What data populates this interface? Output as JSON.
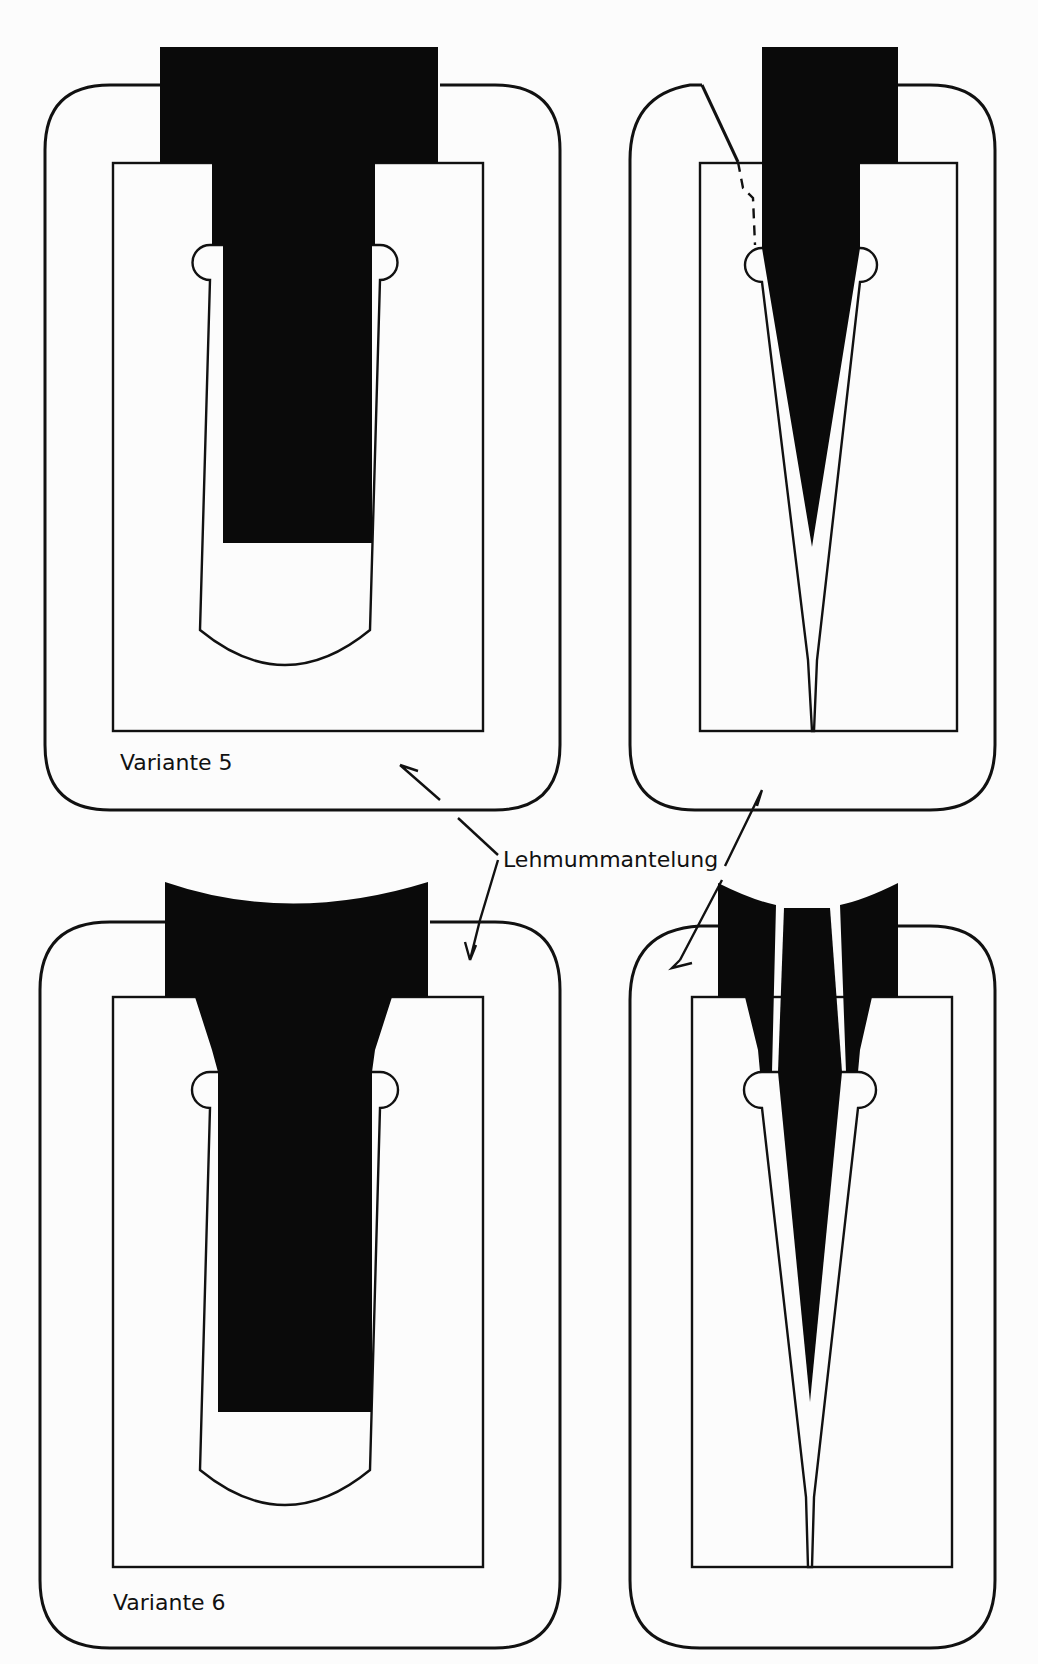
{
  "diagram": {
    "type": "technical cross-section drawing (casting molds)",
    "panels": [
      {
        "id": "v5-left",
        "label": "Variante 5",
        "shape": "T-shaped casting block"
      },
      {
        "id": "v5-right",
        "label": "",
        "shape": "wedge casting with dashed break line"
      },
      {
        "id": "v6-left",
        "label": "Variante 6",
        "shape": "T-shaped casting with concave top and funnel"
      },
      {
        "id": "v6-right",
        "label": "",
        "shape": "wedge casting with concave top and inner core"
      }
    ],
    "annotation": {
      "text": "Lehmummantelung",
      "arrows": 4
    }
  },
  "labels": {
    "variant5": "Variante 5",
    "variant6": "Variante 6",
    "lehm": "Lehmummantelung"
  }
}
